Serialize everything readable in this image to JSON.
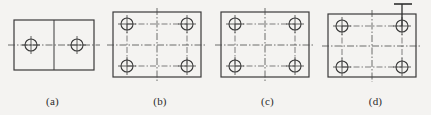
{
  "sheet": {
    "width": 431,
    "height": 115,
    "background_color": "#f4f3f1",
    "line_color": "#3a3a3a",
    "centerline_color": "#4a4a4a",
    "text_color": "#2a2a2a",
    "description": "Four engineering drawing views of a rectangular plate with drilled holes"
  },
  "figures": [
    {
      "id": "a",
      "caption": "(a)",
      "plate": {
        "x": 14,
        "y": 20,
        "width": 80,
        "height": 50
      },
      "divider": {
        "type": "solid-vertical",
        "x": 54,
        "y1": 20,
        "y2": 70
      },
      "horizontal_centerline": {
        "type": "dash-dot",
        "y": 45,
        "x1": 8,
        "x2": 100
      },
      "holes": [
        {
          "cx": 31,
          "cy": 45,
          "r": 6
        },
        {
          "cx": 77,
          "cy": 45,
          "r": 6
        }
      ],
      "hole_count": 2,
      "leader": null
    },
    {
      "id": "b",
      "caption": "(b)",
      "plate": {
        "x": 8,
        "y": 12,
        "width": 88,
        "height": 65
      },
      "divider": {
        "type": "dash-dot-vertical",
        "x": 52,
        "y1": 8,
        "y2": 82
      },
      "horizontal_centerline": {
        "type": "dash-dot",
        "y": 45,
        "x1": 2,
        "x2": 102
      },
      "holes": [
        {
          "cx": 22,
          "cy": 24,
          "r": 6
        },
        {
          "cx": 82,
          "cy": 24,
          "r": 6
        },
        {
          "cx": 22,
          "cy": 66,
          "r": 6
        },
        {
          "cx": 82,
          "cy": 66,
          "r": 6
        }
      ],
      "hole_count": 4,
      "leader": null
    },
    {
      "id": "c",
      "caption": "(c)",
      "plate": {
        "x": 6,
        "y": 12,
        "width": 88,
        "height": 65
      },
      "divider": {
        "type": "dash-dot-vertical",
        "x": 50,
        "y1": 8,
        "y2": 82
      },
      "horizontal_centerline": {
        "type": "dash-dot",
        "y": 45,
        "x1": 0,
        "x2": 100
      },
      "holes": [
        {
          "cx": 20,
          "cy": 24,
          "r": 6
        },
        {
          "cx": 80,
          "cy": 24,
          "r": 6
        },
        {
          "cx": 20,
          "cy": 66,
          "r": 6
        },
        {
          "cx": 80,
          "cy": 66,
          "r": 6
        }
      ],
      "hole_count": 4,
      "leader": null
    },
    {
      "id": "d",
      "caption": "(d)",
      "plate": {
        "x": 8,
        "y": 14,
        "width": 88,
        "height": 63
      },
      "divider": {
        "type": "dash-dot-vertical",
        "x": 52,
        "y1": 10,
        "y2": 82
      },
      "horizontal_centerline": {
        "type": "dash-dot",
        "y": 46,
        "x1": 2,
        "x2": 102
      },
      "holes": [
        {
          "cx": 22,
          "cy": 26,
          "r": 6
        },
        {
          "cx": 82,
          "cy": 26,
          "r": 6
        },
        {
          "cx": 22,
          "cy": 67,
          "r": 6
        },
        {
          "cx": 82,
          "cy": 67,
          "r": 6
        }
      ],
      "hole_count": 4,
      "leader": {
        "type": "vertical-leader-with-crossbar",
        "x": 82,
        "y_top": 4,
        "y_bottom": 26,
        "crossbar_x1": 74,
        "crossbar_x2": 92,
        "crossbar_y": 4
      }
    }
  ]
}
